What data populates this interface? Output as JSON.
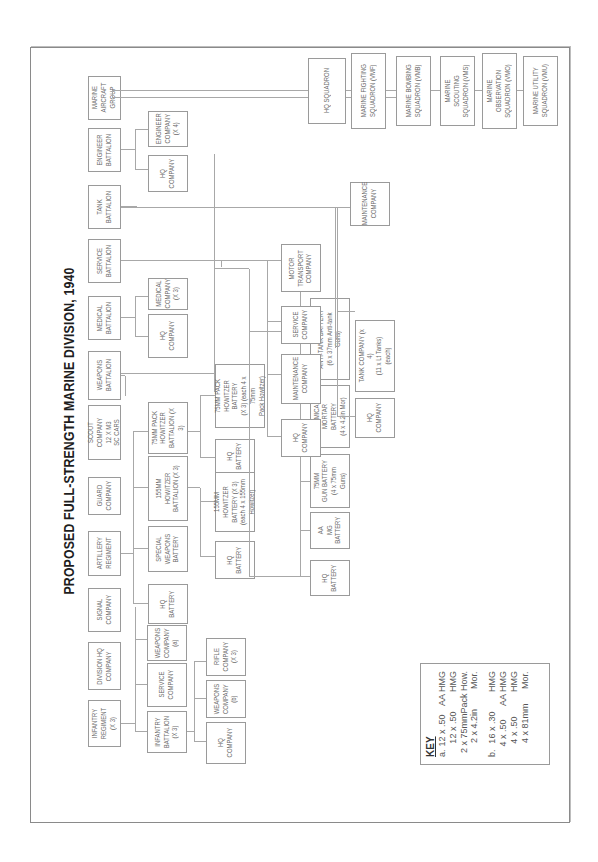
{
  "title": "PROPOSED FULL-STRENGTH MARINE DIVISION, 1940",
  "colors": {
    "box_border": "#9a9a9a",
    "line": "#a8a8a8",
    "text": "#6a6a6a",
    "title": "#1e1e1e"
  },
  "top_level": [
    {
      "id": "inf",
      "label": "INFANTRY\nREGIMENT\n(X 3)"
    },
    {
      "id": "divhq",
      "label": "DIVISION HQ\nCOMPANY"
    },
    {
      "id": "sig",
      "label": "SIGNAL\nCOMPANY"
    },
    {
      "id": "art",
      "label": "ARTILLERY\nREGIMENT"
    },
    {
      "id": "guard",
      "label": "GUARD\nCOMPANY"
    },
    {
      "id": "scout",
      "label": "SCOUT COMPANY\n12 X M3\nSC CARS"
    },
    {
      "id": "wpn",
      "label": "WEAPONS\nBATTALION"
    },
    {
      "id": "med",
      "label": "MEDICAL\nBATTALION"
    },
    {
      "id": "svc",
      "label": "SERVICE\nBATTALION"
    },
    {
      "id": "tank",
      "label": "TANK\nBATTALION"
    },
    {
      "id": "eng",
      "label": "ENGINEER\nBATTALION"
    },
    {
      "id": "mag",
      "label": "MARINE\nAIRCRAFT\nGROUP"
    }
  ],
  "infantry": {
    "children": [
      {
        "label": "INFANTRY\nBATTALION\n(X 3)"
      },
      {
        "label": "SERVICE\nCOMPANY"
      },
      {
        "label": "WEAPONS\nCOMPANY\n(a)"
      }
    ],
    "battalion_children": [
      {
        "label": "HQ\nCOMPANY"
      },
      {
        "label": "WEAPONS\nCOMPANY\n(b)"
      },
      {
        "label": "RIFLE\nCOMPANY\n(X 3)"
      }
    ]
  },
  "artillery": {
    "children": [
      {
        "label": "HQ\nBATTERY"
      },
      {
        "label": "SPECIAL\nWEAPONS\nBATTERY"
      },
      {
        "label": "155MM\nHOWITZER\nBATTALION (X 3)"
      },
      {
        "label": "75MM PACK\nHOWITZER\nBATTALION (X 3)"
      }
    ],
    "howitzer155_children": [
      {
        "label": "HQ\nBATTERY"
      },
      {
        "label": "155MM HOWITZER\nBATTERY (X 3)\n(each 4 x 155mm\nHowitzer)"
      }
    ],
    "pack75_children": [
      {
        "label": "HQ\nBATTERY"
      },
      {
        "label": "75MM PACK\nHOWITZER BATTERY\n(X 3) (each 4 x 75mm\nPack Howitzer)"
      }
    ]
  },
  "weapons": {
    "children": [
      {
        "label": "HQ\nBATTERY"
      },
      {
        "label": "AA\nMG\nBATTERY"
      },
      {
        "label": "75MM\nGUN BATTERY\n(4 x 75mm Guns)"
      },
      {
        "label": "CHEMICAL MORTAR\nBATTERY\n(4 x 4.2in Mor)"
      },
      {
        "label": "ANTI-TANK BATTERY\n(6 x 37mm Anti-tank Guns)"
      }
    ]
  },
  "medical": {
    "children": [
      {
        "label": "HQ\nCOMPANY"
      },
      {
        "label": "MEDICAL\nCOMPANY\n(X 3)"
      }
    ]
  },
  "service": {
    "children": [
      {
        "label": "HQ\nCOMPANY"
      },
      {
        "label": "MAINTENANCE\nCOMPANY"
      },
      {
        "label": "SERVICE\nCOMPANY"
      },
      {
        "label": "MOTOR\nTRANSPORT\nCOMPANY"
      }
    ]
  },
  "tank": {
    "children": [
      {
        "label": "HQ\nCOMPANY"
      },
      {
        "label": "TANK COMPANY (x 4)\n(11 x Lt Tanks)\n(each)"
      },
      {
        "label": "MAINTENANCE\nCOMPANY"
      }
    ]
  },
  "engineer": {
    "children": [
      {
        "label": "HQ\nCOMPANY"
      },
      {
        "label": "ENGINEER\nCOMPANY\n(X 4)"
      }
    ]
  },
  "aircraft": {
    "children": [
      {
        "label": "HQ SQUADRON"
      },
      {
        "label": "MARINE FIGHTING\nSQUADRON (VMF)"
      },
      {
        "label": "MARINE BOMBING\nSQUADRON (VMB)"
      },
      {
        "label": "MARINE SCOUTING\nSQUADRON (VMS)"
      },
      {
        "label": "MARINE OBSERVATION\nSQUADRON (VMO)"
      },
      {
        "label": "MARINE UTILITY\nSQUADRON (VMU)"
      }
    ]
  },
  "key": {
    "title": "KEY",
    "rows": [
      {
        "mark": "a.",
        "qty": "12 x .50",
        "desc": "AA HMG"
      },
      {
        "mark": "",
        "qty": "12 x .50",
        "desc": "HMG"
      },
      {
        "mark": "",
        "qty": "2 x 75mm",
        "desc": "Pack How."
      },
      {
        "mark": "",
        "qty": "2 x 4.2in",
        "desc": "Mor."
      },
      {
        "mark": "b.",
        "qty": "16 x .30",
        "desc": "HMG"
      },
      {
        "mark": "",
        "qty": "4 x .50",
        "desc": "AA HMG"
      },
      {
        "mark": "",
        "qty": "4 x .50",
        "desc": "HMG"
      },
      {
        "mark": "",
        "qty": "4 x 81mm",
        "desc": "Mor."
      }
    ]
  }
}
